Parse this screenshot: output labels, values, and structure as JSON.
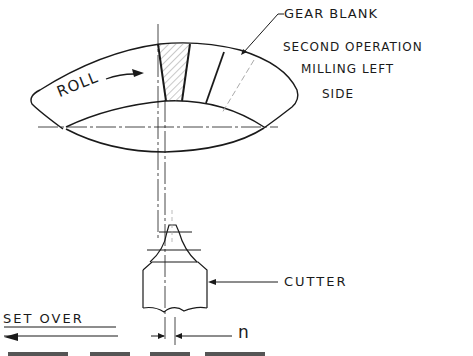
{
  "diagram": {
    "labels": {
      "gear_blank": "GEAR BLANK",
      "operation_line1": "SECOND OPERATION",
      "operation_line2": "MILLING LEFT",
      "operation_line3": "SIDE",
      "roll": "ROLL",
      "cutter": "CUTTER",
      "set_over": "SET OVER",
      "n": "n"
    },
    "colors": {
      "line": "#1a1a1a",
      "hatch": "#777777",
      "dashed": "#999999",
      "background": "#ffffff"
    }
  }
}
